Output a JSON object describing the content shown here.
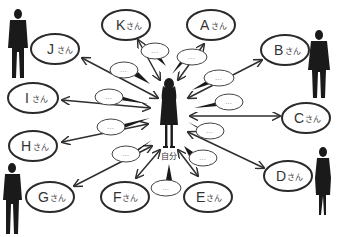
{
  "diagram": {
    "center": {
      "label": "自分",
      "icon": "woman-silhouette"
    },
    "suffix": "さん",
    "bubble_text": "…",
    "nodes": [
      {
        "id": "A",
        "letter": "A",
        "label": "Aさん"
      },
      {
        "id": "B",
        "letter": "B",
        "label": "Bさん"
      },
      {
        "id": "C",
        "letter": "C",
        "label": "Cさん"
      },
      {
        "id": "D",
        "letter": "D",
        "label": "Dさん"
      },
      {
        "id": "E",
        "letter": "E",
        "label": "Eさん"
      },
      {
        "id": "F",
        "letter": "F",
        "label": "Fさん"
      },
      {
        "id": "G",
        "letter": "G",
        "label": "Gさん"
      },
      {
        "id": "H",
        "letter": "H",
        "label": "Hさん"
      },
      {
        "id": "I",
        "letter": "I",
        "label": "Iさん"
      },
      {
        "id": "J",
        "letter": "J",
        "label": "Jさん"
      },
      {
        "id": "K",
        "letter": "K",
        "label": "Kさん"
      }
    ],
    "edges": [
      {
        "from": "自分",
        "to": "A",
        "bidirectional": true
      },
      {
        "from": "自分",
        "to": "B",
        "bidirectional": true
      },
      {
        "from": "自分",
        "to": "C",
        "bidirectional": true
      },
      {
        "from": "自分",
        "to": "D",
        "bidirectional": true
      },
      {
        "from": "自分",
        "to": "E",
        "bidirectional": true
      },
      {
        "from": "自分",
        "to": "F",
        "bidirectional": true
      },
      {
        "from": "自分",
        "to": "G",
        "bidirectional": true
      },
      {
        "from": "自分",
        "to": "H",
        "bidirectional": true
      },
      {
        "from": "自分",
        "to": "I",
        "bidirectional": true
      },
      {
        "from": "自分",
        "to": "J",
        "bidirectional": true
      },
      {
        "from": "自分",
        "to": "K",
        "bidirectional": true
      }
    ],
    "decorations": [
      {
        "icon": "man-silhouette",
        "position": "top-left"
      },
      {
        "icon": "man-silhouette",
        "position": "top-right"
      },
      {
        "icon": "man-silhouette",
        "position": "bottom-left"
      },
      {
        "icon": "woman-silhouette",
        "position": "bottom-right"
      }
    ]
  }
}
